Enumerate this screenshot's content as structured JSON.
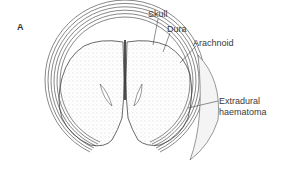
{
  "figure": {
    "panel_letter": "A",
    "labels": {
      "skull": "Skull",
      "dura": "Dura",
      "arachnoid": "Arachnoid",
      "extradural_line1": "Extradural",
      "extradural_line2": "haematoma"
    },
    "colors": {
      "line": "#444444",
      "stipple": "#9a9a9a",
      "haematoma_fill": "#f4f4f4",
      "background": "#ffffff"
    }
  }
}
